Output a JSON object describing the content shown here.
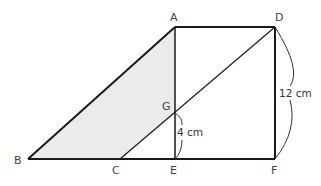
{
  "diagram": {
    "points": {
      "A": {
        "label": "A",
        "x": 175,
        "y": 27
      },
      "D": {
        "label": "D",
        "x": 275,
        "y": 27
      },
      "B": {
        "label": "B",
        "x": 28,
        "y": 159
      },
      "C": {
        "label": "C",
        "x": 120,
        "y": 159
      },
      "E": {
        "label": "E",
        "x": 175,
        "y": 159
      },
      "F": {
        "label": "F",
        "x": 275,
        "y": 159
      },
      "G": {
        "label": "G",
        "x": 175,
        "y": 113
      }
    },
    "measurements": {
      "DF": "12 cm",
      "GE": "4 cm"
    },
    "shaded_region": "ABCG",
    "colors": {
      "shade": "#ebebeb",
      "line": "#1a1a1a",
      "text": "#444444"
    }
  }
}
